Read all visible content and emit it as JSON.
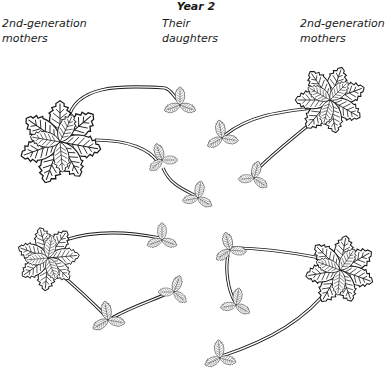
{
  "figure": {
    "title": "Year 2",
    "labels": {
      "left": "2nd-generation mothers",
      "middle": "Their daughters",
      "right": "2nd-generation mothers"
    },
    "colors": {
      "ink": "#1a1a1a",
      "background": "#ffffff"
    },
    "groups": [
      {
        "name": "top-left",
        "mother": [
          68,
          140
        ],
        "daughters": [
          [
            178,
            122
          ],
          [
            158,
            165
          ],
          [
            196,
            200
          ]
        ]
      },
      {
        "name": "top-right",
        "mother": [
          332,
          95
        ],
        "daughters": [
          [
            222,
            138
          ],
          [
            252,
            178
          ]
        ]
      },
      {
        "name": "bottom-left",
        "mother": [
          48,
          255
        ],
        "daughters": [
          [
            162,
            240
          ],
          [
            108,
            320
          ],
          [
            175,
            290
          ]
        ]
      },
      {
        "name": "bottom-right",
        "mother": [
          340,
          270
        ],
        "daughters": [
          [
            228,
            250
          ],
          [
            235,
            305
          ],
          [
            218,
            358
          ]
        ]
      }
    ]
  }
}
